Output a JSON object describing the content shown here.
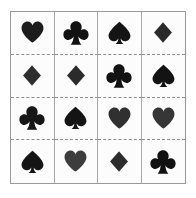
{
  "image": {
    "title": "Playing card suit symbol grid",
    "description": "Four by four grid of playing card suit symbols separated by solid vertical lines and dashed horizontal lines",
    "background_color": "#ffffff",
    "frame_color": "#9a9a9a",
    "vertical_rule_color": "#a8a8a8",
    "horizontal_rule_color": "#8f8f8f",
    "cell_background": "#fcfcfc",
    "rows": 4,
    "columns": 4
  },
  "palette": {
    "ink_black": "#141414",
    "ink_dark": "#222222",
    "ink_gray": "#3c3c3c",
    "ink_mid_gray": "#4a4a4a"
  },
  "cells": [
    {
      "row": 1,
      "column": 1,
      "suit": "heart",
      "icon": "heart-icon",
      "symbol": "♥",
      "color": "#1c1c1c"
    },
    {
      "row": 1,
      "column": 2,
      "suit": "club",
      "icon": "club-icon",
      "symbol": "♣",
      "color": "#121212"
    },
    {
      "row": 1,
      "column": 3,
      "suit": "spade",
      "icon": "spade-icon",
      "symbol": "♠",
      "color": "#141414"
    },
    {
      "row": 1,
      "column": 4,
      "suit": "diamond",
      "icon": "diamond-icon",
      "symbol": "♦",
      "color": "#2a2a2a"
    },
    {
      "row": 2,
      "column": 1,
      "suit": "diamond",
      "icon": "diamond-icon",
      "symbol": "♦",
      "color": "#2e2e2e"
    },
    {
      "row": 2,
      "column": 2,
      "suit": "diamond",
      "icon": "diamond-icon",
      "symbol": "♦",
      "color": "#2b2b2b"
    },
    {
      "row": 2,
      "column": 3,
      "suit": "club",
      "icon": "club-icon",
      "symbol": "♣",
      "color": "#131313"
    },
    {
      "row": 2,
      "column": 4,
      "suit": "spade",
      "icon": "spade-icon",
      "symbol": "♠",
      "color": "#131313"
    },
    {
      "row": 3,
      "column": 1,
      "suit": "club",
      "icon": "club-icon",
      "symbol": "♣",
      "color": "#161616"
    },
    {
      "row": 3,
      "column": 2,
      "suit": "spade",
      "icon": "spade-icon",
      "symbol": "♠",
      "color": "#141414"
    },
    {
      "row": 3,
      "column": 3,
      "suit": "heart",
      "icon": "heart-icon",
      "symbol": "♥",
      "color": "#303030"
    },
    {
      "row": 3,
      "column": 4,
      "suit": "heart",
      "icon": "heart-icon",
      "symbol": "♥",
      "color": "#363636"
    },
    {
      "row": 4,
      "column": 1,
      "suit": "spade",
      "icon": "spade-icon",
      "symbol": "♠",
      "color": "#151515"
    },
    {
      "row": 4,
      "column": 2,
      "suit": "heart",
      "icon": "heart-icon",
      "symbol": "♥",
      "color": "#3d3d3d"
    },
    {
      "row": 4,
      "column": 3,
      "suit": "diamond",
      "icon": "diamond-icon",
      "symbol": "♦",
      "color": "#2d2d2d"
    },
    {
      "row": 4,
      "column": 4,
      "suit": "club",
      "icon": "club-icon",
      "symbol": "♣",
      "color": "#111111"
    }
  ]
}
